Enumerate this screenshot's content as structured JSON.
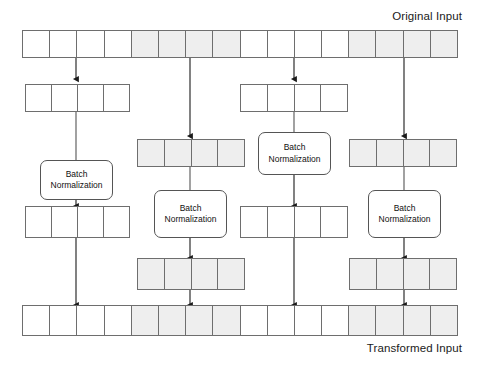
{
  "diagram": {
    "title_top": "Original Input",
    "title_bottom": "Transformed Input",
    "shade_color": "#eeeeee",
    "line_color": "#6e6e6e",
    "arrow_color": "#1a1a1a",
    "bn_label_line1": "Batch",
    "bn_label_line2": "Normalization"
  },
  "rows": {
    "original_input": {
      "name": "Original Input",
      "cell_count": 16,
      "shaded": [
        false,
        false,
        false,
        false,
        true,
        true,
        true,
        true,
        false,
        false,
        false,
        false,
        true,
        true,
        true,
        true
      ]
    },
    "transformed_input": {
      "name": "Transformed Input",
      "cell_count": 16,
      "shaded": [
        false,
        false,
        false,
        false,
        true,
        true,
        true,
        true,
        false,
        false,
        false,
        false,
        true,
        true,
        true,
        true
      ]
    },
    "group1_in": {
      "name": "Group 1 Input Slice",
      "cell_count": 4,
      "shaded": [
        false,
        false,
        false,
        false
      ]
    },
    "group1_out": {
      "name": "Group 1 Output Slice",
      "cell_count": 4,
      "shaded": [
        false,
        false,
        false,
        false
      ]
    },
    "group2_in": {
      "name": "Group 2 Input Slice",
      "cell_count": 4,
      "shaded": [
        true,
        true,
        true,
        true
      ]
    },
    "group2_out": {
      "name": "Group 2 Output Slice",
      "cell_count": 4,
      "shaded": [
        true,
        true,
        true,
        true
      ]
    },
    "group3_in": {
      "name": "Group 3 Input Slice",
      "cell_count": 4,
      "shaded": [
        false,
        false,
        false,
        false
      ]
    },
    "group3_out": {
      "name": "Group 3 Output Slice",
      "cell_count": 4,
      "shaded": [
        false,
        false,
        false,
        false
      ]
    },
    "group4_in": {
      "name": "Group 4 Input Slice",
      "cell_count": 4,
      "shaded": [
        true,
        true,
        true,
        true
      ]
    },
    "group4_out": {
      "name": "Group 4 Output Slice",
      "cell_count": 4,
      "shaded": [
        true,
        true,
        true,
        true
      ]
    }
  },
  "batch_norm_blocks": [
    {
      "id": "bn1",
      "line1": "Batch",
      "line2": "Normalization"
    },
    {
      "id": "bn2",
      "line1": "Batch",
      "line2": "Normalization"
    },
    {
      "id": "bn3",
      "line1": "Batch",
      "line2": "Normalization"
    },
    {
      "id": "bn4",
      "line1": "Batch",
      "line2": "Normalization"
    }
  ]
}
